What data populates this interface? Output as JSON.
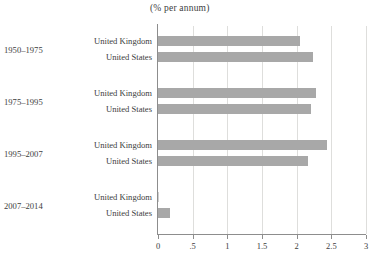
{
  "chart_data": {
    "type": "bar",
    "orientation": "horizontal",
    "title": "(% per annum)",
    "xlabel": "",
    "ylabel": "",
    "xlim": [
      0,
      3
    ],
    "grid": true,
    "legend": "none",
    "tick_labels": [
      "0",
      ".5",
      "1",
      "1.5",
      "2",
      "2.5",
      "3"
    ],
    "tick_values": [
      0,
      0.5,
      1,
      1.5,
      2,
      2.5,
      3
    ],
    "groups": [
      {
        "period": "1950–1975",
        "bars": [
          {
            "label": "United Kingdom",
            "value": 2.05
          },
          {
            "label": "United States",
            "value": 2.24
          }
        ]
      },
      {
        "period": "1975–1995",
        "bars": [
          {
            "label": "United Kingdom",
            "value": 2.28
          },
          {
            "label": "United States",
            "value": 2.21
          }
        ]
      },
      {
        "period": "1995–2007",
        "bars": [
          {
            "label": "United Kingdom",
            "value": 2.44
          },
          {
            "label": "United States",
            "value": 2.16
          }
        ]
      },
      {
        "period": "2007–2014",
        "bars": [
          {
            "label": "United Kingdom",
            "value": 0.02
          },
          {
            "label": "United States",
            "value": 0.17
          }
        ]
      }
    ],
    "categories": [
      "1950–1975 United Kingdom",
      "1950–1975 United States",
      "1975–1995 United Kingdom",
      "1975–1995 United States",
      "1995–2007 United Kingdom",
      "1995–2007 United States",
      "2007–2014 United Kingdom",
      "2007–2014 United States"
    ],
    "values": [
      2.05,
      2.24,
      2.28,
      2.21,
      2.44,
      2.16,
      0.02,
      0.17
    ],
    "colors": {
      "bar": "#a8a8a8",
      "gridline": "#dededc",
      "axis": "#8d8d8d",
      "text": "#3d3d3d",
      "background": "#ffffff"
    }
  }
}
